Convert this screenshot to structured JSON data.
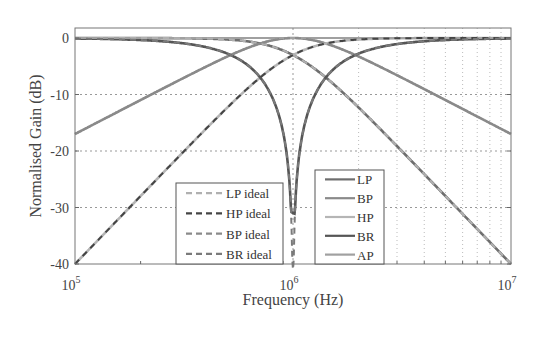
{
  "chart_data": {
    "type": "line",
    "title": "",
    "xlabel": "Frequency (Hz)",
    "ylabel": "Normalised Gain (dB)",
    "xscale": "log",
    "xlim": [
      100000,
      10000000
    ],
    "ylim": [
      -40,
      2
    ],
    "x_ticks": [
      {
        "base": "10",
        "exp": "5"
      },
      {
        "base": "10",
        "exp": "6"
      },
      {
        "base": "10",
        "exp": "7"
      }
    ],
    "y_ticks": [
      0,
      -10,
      -20,
      -30,
      -40
    ],
    "grid": true,
    "center_frequency_hz": 1000000,
    "q_factor": 0.707,
    "x": [
      100000,
      200000,
      300000,
      500000,
      700000,
      1000000,
      1500000,
      2000000,
      3000000,
      5000000,
      10000000
    ],
    "series": [
      {
        "name": "LP",
        "style": "solid",
        "color": "#6e6e6e",
        "values": [
          0.0,
          0.0,
          -0.03,
          -0.26,
          -0.95,
          -3.0,
          -7.5,
          -12.3,
          -19.1,
          -28.0,
          -40.0
        ]
      },
      {
        "name": "BP",
        "style": "solid",
        "color": "#8a8a8a",
        "values": [
          -17.0,
          -11.0,
          -7.5,
          -3.0,
          -1.0,
          0.0,
          -1.3,
          -3.0,
          -7.5,
          -14.2,
          -17.0
        ]
      },
      {
        "name": "HP",
        "style": "solid",
        "color": "#b5b5b5",
        "values": [
          -40.0,
          -28.0,
          -21.0,
          -12.3,
          -6.9,
          -3.0,
          -0.9,
          -0.3,
          -0.03,
          0.0,
          0.0
        ]
      },
      {
        "name": "BR",
        "style": "solid",
        "color": "#555555",
        "values": [
          -0.09,
          -0.4,
          -0.9,
          -3.0,
          -6.9,
          -28.0,
          -6.0,
          -3.0,
          -0.9,
          -0.17,
          -0.09
        ]
      },
      {
        "name": "AP",
        "style": "solid",
        "color": "#a0a0a0",
        "values": [
          0,
          0,
          0,
          0,
          0,
          0,
          0,
          0,
          0,
          0,
          0
        ]
      },
      {
        "name": "LP ideal",
        "style": "dashed",
        "color": "#b0b0b0"
      },
      {
        "name": "HP ideal",
        "style": "dashed",
        "color": "#444444"
      },
      {
        "name": "BP ideal",
        "style": "dashed",
        "color": "#8a8a8a"
      },
      {
        "name": "BR ideal",
        "style": "dashed",
        "color": "#7a7a7a"
      }
    ],
    "legends": [
      {
        "position": "lower-center",
        "entries": [
          "LP ideal",
          "HP ideal",
          "BP ideal",
          "BR ideal"
        ]
      },
      {
        "position": "lower-center-right",
        "entries": [
          "LP",
          "BP",
          "HP",
          "BR",
          "AP"
        ]
      }
    ]
  },
  "labels": {
    "xlabel": "Frequency (Hz)",
    "ylabel": "Normalised Gain (dB)"
  }
}
